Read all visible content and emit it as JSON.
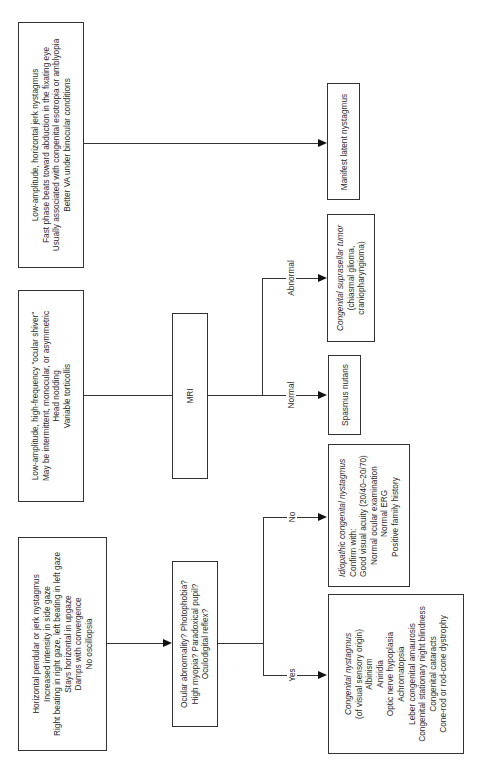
{
  "diagram": {
    "type": "flowchart",
    "orientation": "rotated-90-ccw",
    "rows": {
      "latent": {
        "findings": [
          "Low-amplitude, horizontal jerk nystagmus",
          "Fast phase beats toward abduction in the fixating eye",
          "Usually associated with congenital esotropia or amblyopia",
          "Better VA under binocular conditions"
        ],
        "outcome": "Manifest latent nystagmus"
      },
      "spasmus": {
        "findings": [
          "Low-amplitude, high-frequency \"ocular shiver\"",
          "May be intermittent, monocular, or asymmetric",
          "Head nodding",
          "Variable torticollis"
        ],
        "test": "MRI",
        "branches": [
          {
            "label": "Abnormal",
            "outcome_title": "Congenital suprasellar tumor",
            "outcome_lines": [
              "(chiasmal glioma,",
              "craniopharyngioma)"
            ]
          },
          {
            "label": "Normal",
            "outcome_title": "Spasmus nutans",
            "outcome_lines": []
          }
        ]
      },
      "congenital": {
        "findings": [
          "Horizontal pendular or jerk nystagmus",
          "Increased intensity in side gaze",
          "Right beating in right gaze, left beating in left gaze",
          "Stays horizontal in upgaze",
          "Damps with convergence",
          "No oscillopsia"
        ],
        "question": [
          "Ocular abnormality? Photophobia?",
          "High myopia? Paradoxical pupil?",
          "Oculodigital reflex?"
        ],
        "branches": [
          {
            "label": "No",
            "outcome_title": "Idiopathic congenital nystagmus",
            "outcome_lines": [
              "Confirm with:",
              "Good visual acuity (20/40–20/70)",
              "Normal ocular examination",
              "Normal ERG",
              "Positive family history"
            ]
          },
          {
            "label": "Yes",
            "outcome_title": "Congenital nystagmus",
            "outcome_lines": [
              "(of visual sensory origin)",
              "Albinism",
              "Aniridia",
              "Optic nerve hypoplasia",
              "Achromatopsia",
              "Leber congenital amaurosis",
              "Congenital stationary night blindness",
              "Congenital cataracts",
              "Cone-rod or rod-cone dystrophy"
            ]
          }
        ]
      }
    }
  }
}
